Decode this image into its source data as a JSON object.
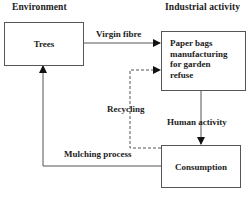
{
  "diagram": {
    "headings": {
      "left": "Environment",
      "right": "Industrial activity"
    },
    "nodes": {
      "trees": "Trees",
      "paper_bags": [
        "Paper bags",
        "manufacturing",
        "for garden",
        "refuse"
      ],
      "consumption": "Consumption"
    },
    "edges": {
      "virgin_fibre": "Virgin fibre",
      "human_activity": "Human activity",
      "recycling": "Recycling",
      "mulching": "Mulching process"
    },
    "colors": {
      "line": "#555555",
      "text": "#222222",
      "background": "#ffffff"
    }
  }
}
